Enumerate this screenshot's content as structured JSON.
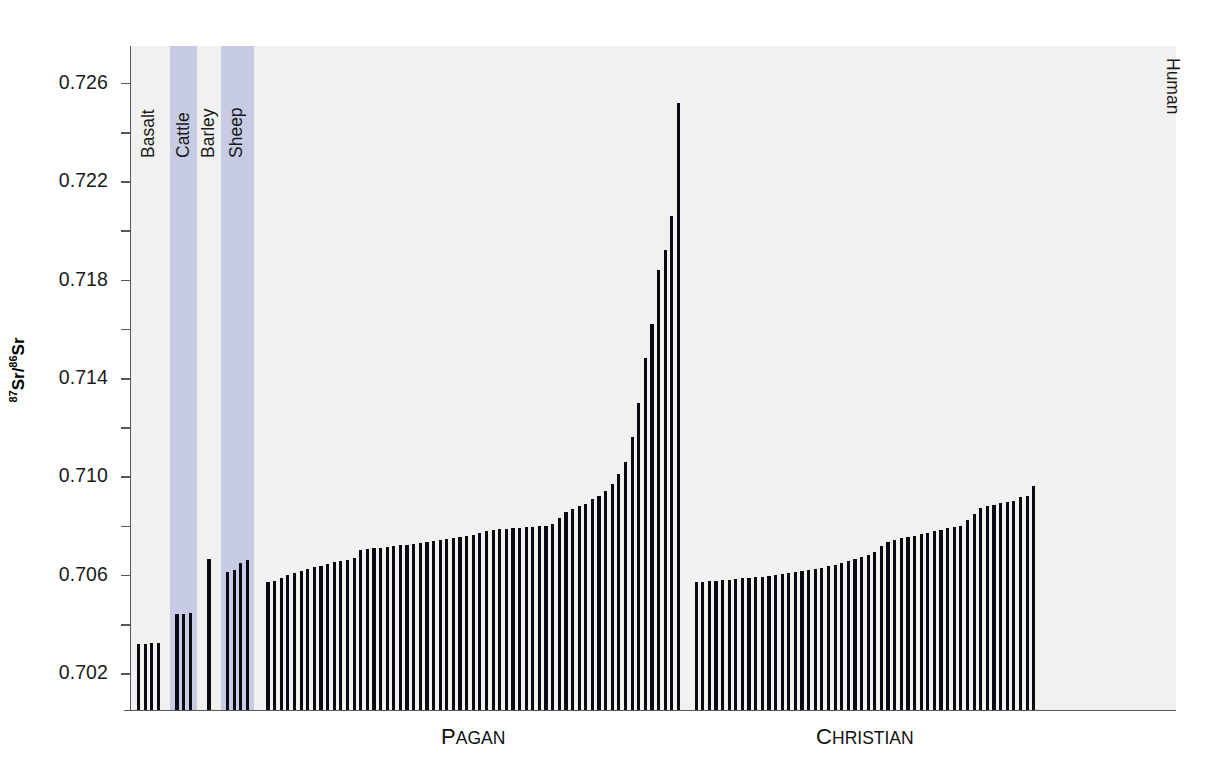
{
  "chart_data": {
    "type": "bar",
    "title": "",
    "xlabel": "",
    "ylabel": "87Sr/86Sr",
    "ylabel_html": "<sup>87</sup>Sr/<sup>86</sup>Sr",
    "ylim": [
      0.7005,
      0.7275
    ],
    "yticks": [
      0.702,
      0.706,
      0.71,
      0.714,
      0.718,
      0.722,
      0.726
    ],
    "ytick_labels": [
      "0.702",
      "0.706",
      "0.710",
      "0.714",
      "0.718",
      "0.722",
      "0.726"
    ],
    "yminor_ticks": [
      0.704,
      0.708,
      0.712,
      0.716,
      0.72,
      0.724
    ],
    "grid": "horizontal-bands",
    "legend": "none",
    "band_color": "#f1f1ef",
    "bar_color": "#0a0a12",
    "highlight_color": "#bfc4e0",
    "axis_color": "#58585a",
    "annotations": [
      {
        "name": "Basalt",
        "rotation": -90
      },
      {
        "name": "Cattle",
        "rotation": -90
      },
      {
        "name": "Barley",
        "rotation": -90
      },
      {
        "name": "Sheep",
        "rotation": -90
      },
      {
        "name": "Human",
        "rotation": 90
      }
    ],
    "group_labels": [
      {
        "label": "Pagan",
        "label_display": "PAGAN"
      },
      {
        "label": "Christian",
        "label_display": "CHRISTIAN"
      }
    ],
    "groups": [
      {
        "name": "Basalt",
        "highlighted": false,
        "values": [
          0.7032,
          0.7032,
          0.70322,
          0.70323
        ]
      },
      {
        "name": "Cattle",
        "highlighted": true,
        "values": [
          0.7044,
          0.70441,
          0.70446
        ]
      },
      {
        "name": "Barley",
        "highlighted": false,
        "values": [
          0.70664
        ]
      },
      {
        "name": "Sheep",
        "highlighted": true,
        "values": [
          0.70612,
          0.7062,
          0.70648,
          0.7066
        ]
      },
      {
        "name": "Pagan",
        "highlighted": false,
        "values": [
          0.70572,
          0.70574,
          0.70588,
          0.706,
          0.70608,
          0.70616,
          0.70622,
          0.7063,
          0.70636,
          0.70644,
          0.7065,
          0.70656,
          0.70662,
          0.70668,
          0.707,
          0.70704,
          0.70708,
          0.7071,
          0.70714,
          0.70716,
          0.7072,
          0.70722,
          0.70726,
          0.7073,
          0.70734,
          0.70736,
          0.7074,
          0.70744,
          0.70748,
          0.70752,
          0.70756,
          0.7076,
          0.70768,
          0.70776,
          0.70782,
          0.70786,
          0.70788,
          0.7079,
          0.70792,
          0.70794,
          0.70796,
          0.70797,
          0.708,
          0.70808,
          0.7083,
          0.70856,
          0.70868,
          0.70878,
          0.70888,
          0.7091,
          0.7092,
          0.7094,
          0.7097,
          0.7101,
          0.7106,
          0.7116,
          0.713,
          0.7148,
          0.7162,
          0.7184,
          0.7192,
          0.7206,
          0.7252
        ]
      },
      {
        "name": "Christian",
        "highlighted": false,
        "values": [
          0.7057,
          0.70572,
          0.70574,
          0.70576,
          0.70578,
          0.7058,
          0.70584,
          0.70586,
          0.70588,
          0.7059,
          0.70592,
          0.70594,
          0.70598,
          0.70602,
          0.70606,
          0.7061,
          0.70614,
          0.70618,
          0.70622,
          0.70628,
          0.70634,
          0.7064,
          0.70648,
          0.70656,
          0.70666,
          0.70672,
          0.7068,
          0.70694,
          0.70716,
          0.70732,
          0.70742,
          0.70748,
          0.70752,
          0.70758,
          0.70764,
          0.7077,
          0.70778,
          0.70784,
          0.7079,
          0.70796,
          0.708,
          0.70824,
          0.70846,
          0.7087,
          0.7088,
          0.70884,
          0.7089,
          0.70896,
          0.709,
          0.70918,
          0.7092,
          0.7096
        ]
      }
    ]
  }
}
